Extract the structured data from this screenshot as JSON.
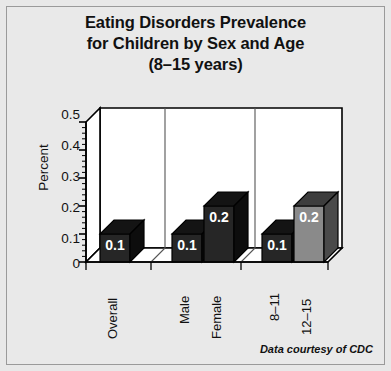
{
  "figure": {
    "background_color": "#e8e8e8",
    "border_color": "#9a9a9a",
    "footer": "Data courtesy of CDC"
  },
  "chart_data": {
    "type": "bar",
    "title": "Eating Disorders Prevalence for Children by Sex and Age (8–15 years)",
    "title_lines": [
      "Eating Disorders Prevalence",
      "for Children by Sex and Age",
      "(8–15 years)"
    ],
    "xlabel": "",
    "ylabel": "Percent",
    "ylim": [
      0,
      0.5
    ],
    "yticks": [
      0,
      0.1,
      0.2,
      0.3,
      0.4,
      0.5
    ],
    "ytick_labels": [
      "0",
      "0.1",
      "0.2",
      "0.3",
      "0.4",
      "0.5"
    ],
    "minor_tick_step": 0.02,
    "grid": false,
    "legend": false,
    "three_d": true,
    "categories": [
      "Overall",
      "Male",
      "Female",
      "8–11",
      "12–15"
    ],
    "values": [
      0.1,
      0.2,
      0.2,
      0.1,
      0.2
    ],
    "data_labels": [
      "0.1",
      "0.1",
      "0.2",
      "0.1",
      "0.2"
    ],
    "groups": [
      {
        "name": "Overall",
        "categories": [
          "Overall"
        ]
      },
      {
        "name": "Sex",
        "categories": [
          "Male",
          "Female"
        ]
      },
      {
        "name": "Age",
        "categories": [
          "8–11",
          "12–15"
        ]
      }
    ],
    "bar_colors": [
      "#262626",
      "#262626",
      "#262626",
      "#262626",
      "#8a8a8a"
    ],
    "bar_top_colors": [
      "#141414",
      "#141414",
      "#141414",
      "#141414",
      "#3d3d3d"
    ],
    "bar_side_colors": [
      "#0d0d0d",
      "#0d0d0d",
      "#0d0d0d",
      "#0d0d0d",
      "#4a4a4a"
    ],
    "label_color": "#ffffff",
    "axis_color": "#000000",
    "plot_background": "#ffffff"
  }
}
